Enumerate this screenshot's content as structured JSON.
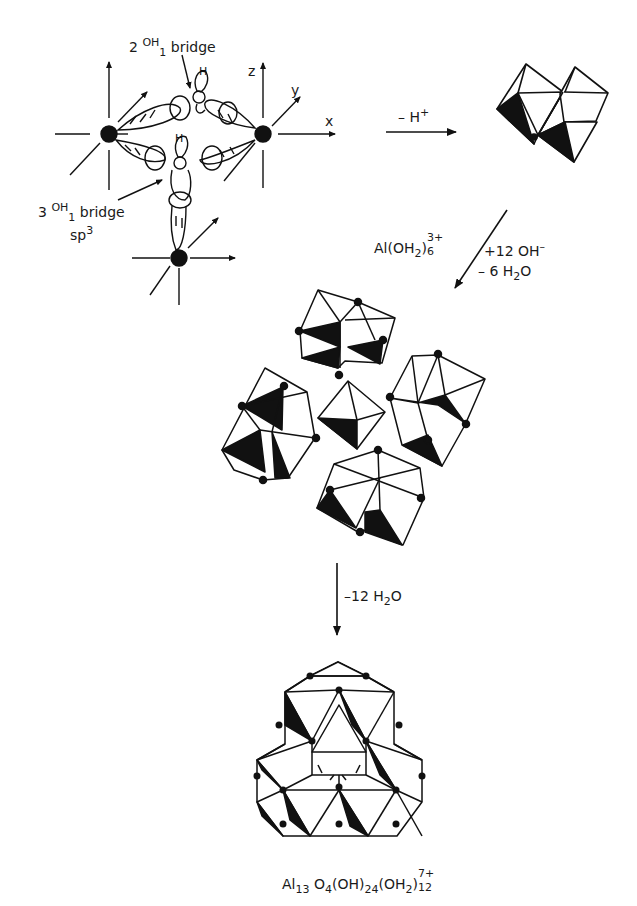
{
  "diagram": {
    "orbital_panel": {
      "labels": {
        "bridge_2": {
          "coef": "2",
          "species": "OH",
          "sub": "1",
          "word": "bridge"
        },
        "bridge_3": {
          "coef": "3",
          "species": "OH",
          "sub": "1",
          "word": "bridge",
          "hybrid": "sp",
          "hybrid_sup": "3"
        },
        "axis_x": "x",
        "axis_y": "y",
        "axis_z": "z",
        "hydrogen": "H"
      },
      "metal_centers": 3
    },
    "steps": [
      {
        "id": "step1",
        "direction": "right",
        "label_main": "– H",
        "label_sup": "+"
      },
      {
        "id": "step2",
        "direction": "down-left",
        "species_left": {
          "main": "Al(OH",
          "sub": "2",
          "close": ")",
          "stack_sub": "6",
          "stack_sup": "3+"
        },
        "line1": {
          "main": "+12 OH",
          "sup": "–"
        },
        "line2": {
          "main": "– 6 H",
          "sub": "2",
          "end": "O"
        }
      },
      {
        "id": "step3",
        "direction": "down",
        "label": {
          "main": "–12 H",
          "sub": "2",
          "end": "O"
        }
      }
    ],
    "structures": [
      {
        "id": "dimer",
        "description": "edge-sharing octahedral dimer"
      },
      {
        "id": "intermediate",
        "description": "four trimeric octahedral groups surrounding central tetrahedron"
      },
      {
        "id": "keggin",
        "description": "Al13 Keggin polycation"
      }
    ],
    "product_formula": {
      "al": "Al",
      "al_sub": "13",
      "o": "O",
      "o_sub": "4",
      "oh": "(OH)",
      "oh_sub": "24",
      "oh2": "(OH",
      "oh2_sub": "2",
      "oh2_close": ")",
      "stack_sub": "12",
      "stack_sup": "7+"
    },
    "colors": {
      "ink": "#111111",
      "fill": "#ffffff",
      "shade": "#111111"
    }
  }
}
